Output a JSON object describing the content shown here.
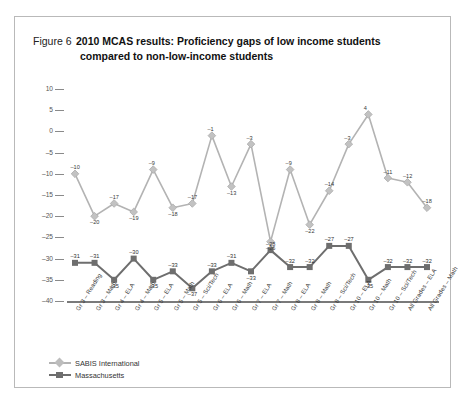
{
  "figure": {
    "label": "Figure 6",
    "title_line1": "2010 MCAS results: Proficiency gaps of low income students",
    "title_line2": "compared to non-low-income students"
  },
  "chart_data": {
    "type": "line",
    "title": "2010 MCAS results: Proficiency gaps of low income students compared to non-low-income students",
    "xlabel": "",
    "ylabel": "",
    "ylim": [
      -40,
      10
    ],
    "ytick_step": 5,
    "yticks": [
      10,
      5,
      0,
      -5,
      -10,
      -15,
      -20,
      -25,
      -30,
      -35,
      -40
    ],
    "grid": false,
    "legend_position": "bottom-left",
    "categories": [
      "Gr 3 – Reading",
      "Gr 3 – Math",
      "Gr 4 – ELA",
      "Gr 4 – Math",
      "Gr 5 – ELA",
      "Gr 5 – Math",
      "Gr 5 – Sci/Tech",
      "Gr 6 – ELA",
      "Gr 6 – Math",
      "Gr 7 – ELA",
      "Gr 7 – Math",
      "Gr 8 – ELA",
      "Gr 8 – Math",
      "Gr 8 – Sci/Tech",
      "Gr 10 – ELA",
      "Gr 10 – Math",
      "Gr 10 – Sci/Tech",
      "All Grades – ELA",
      "All Grades – Math"
    ],
    "series": [
      {
        "name": "SABIS International",
        "color": "#b3b3b3",
        "marker": "diamond",
        "values": [
          -10,
          -20,
          -17,
          -19,
          -9,
          -18,
          -17,
          -1,
          -13,
          -3,
          -26,
          -9,
          -22,
          -14,
          -3,
          4,
          -11,
          -12,
          -18
        ]
      },
      {
        "name": "Massachusetts",
        "color": "#6e6e6e",
        "marker": "square",
        "values": [
          -31,
          -31,
          -35,
          -30,
          -35,
          -33,
          -37,
          -33,
          -31,
          -33,
          -28,
          -32,
          -32,
          -27,
          -27,
          -35,
          -32,
          -32,
          -32
        ]
      }
    ]
  },
  "legend": [
    {
      "label": "SABIS International"
    },
    {
      "label": "Massachusetts"
    }
  ]
}
